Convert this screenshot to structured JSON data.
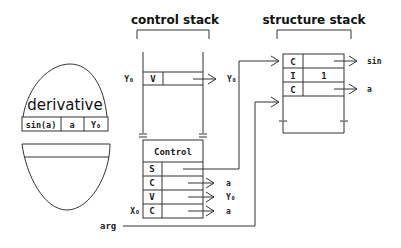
{
  "titles": {
    "control_stack": "control stack",
    "structure_stack": "structure stack"
  },
  "egg": {
    "name": "derivative",
    "cells": [
      "sin(a)",
      "a",
      "Y₀"
    ]
  },
  "control_stack": {
    "top_entry": {
      "side_label": "Y₀",
      "tag": "V",
      "pointer_label": "Y₀"
    },
    "frame_header": "Control",
    "rows": [
      {
        "side_label": "",
        "tag": "S",
        "pointer_label": ""
      },
      {
        "side_label": "",
        "tag": "C",
        "pointer_label": "a"
      },
      {
        "side_label": "",
        "tag": "V",
        "pointer_label": "Y₀"
      },
      {
        "side_label": "X₀",
        "tag": "C",
        "pointer_label": "a"
      }
    ]
  },
  "structure_stack": {
    "rows": [
      {
        "tag": "C",
        "value": "",
        "pointer_label": "sin"
      },
      {
        "tag": "I",
        "value": "1",
        "pointer_label": ""
      },
      {
        "tag": "C",
        "value": "",
        "pointer_label": "a"
      }
    ]
  },
  "arg_label": "arg"
}
